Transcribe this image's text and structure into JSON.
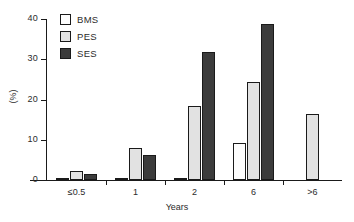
{
  "chart_data": {
    "type": "bar",
    "title": "",
    "xlabel": "Years",
    "ylabel": "(%)",
    "categories": [
      "≤0.5",
      "1",
      "2",
      "6",
      ">6"
    ],
    "series": [
      {
        "name": "BMS",
        "color": "#fdfdfd",
        "values": [
          0.5,
          0.5,
          0.5,
          9.2,
          null
        ]
      },
      {
        "name": "PES",
        "color": "#e2e2e2",
        "values": [
          2.3,
          8.0,
          18.5,
          24.3,
          16.3
        ]
      },
      {
        "name": "SES",
        "color": "#3c3c3c",
        "values": [
          1.4,
          6.1,
          31.7,
          38.8,
          null
        ]
      }
    ],
    "ylim": [
      0,
      40
    ],
    "yticks": [
      0,
      10,
      20,
      30,
      40
    ],
    "ytick_labels": [
      "0",
      "10",
      "20",
      "30",
      "40"
    ],
    "grid": false,
    "legend_position": "top-left"
  },
  "legend": {
    "items": [
      {
        "label": "BMS"
      },
      {
        "label": "PES"
      },
      {
        "label": "SES"
      }
    ]
  },
  "axes": {
    "y_title": "(%)",
    "x_title": "Years"
  }
}
